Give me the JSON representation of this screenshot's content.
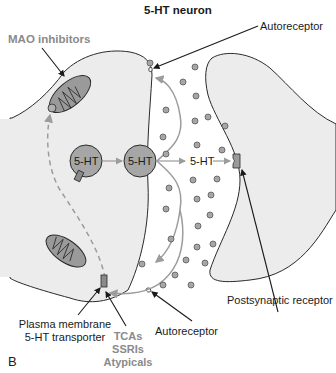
{
  "figure": {
    "title": "5-HT neuron",
    "panel_letter": "B",
    "colors": {
      "presynaptic_fill": "#ececec",
      "postsynaptic_fill": "#ececec",
      "vesicle_fill": "#a6a6a6",
      "mitochondria_fill": "#9a9a9a",
      "arrow_gray": "#9c9c9c",
      "outline": "#2a2a2a",
      "drug_label": "#8a8a8a"
    }
  },
  "labels": {
    "mao_inhibitors": "MAO inhibitors",
    "autoreceptor_top": "Autoreceptor",
    "autoreceptor_bottom": "Autoreceptor",
    "postsynaptic_receptor": "Postsynaptic receptor",
    "transporter_line1": "Plasma membrane",
    "transporter_line2": "5-HT transporter",
    "drug1": "TCAs",
    "drug2": "SSRIs",
    "drug3": "Atypicals"
  },
  "nodes": {
    "vesicle_left": "5-HT",
    "vesicle_right": "5-HT",
    "cleft_label": "5-HT"
  }
}
